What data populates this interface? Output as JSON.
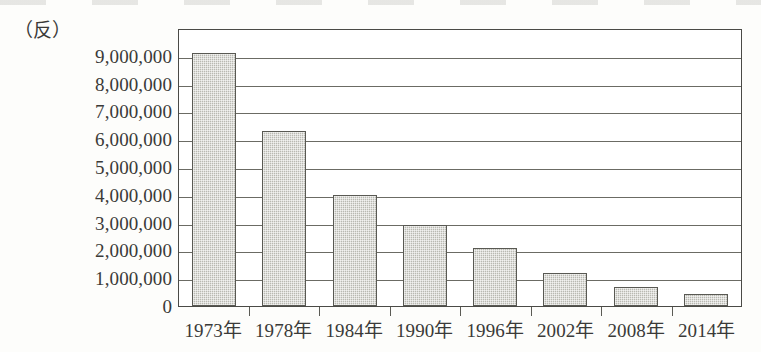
{
  "unit_label": "（反）",
  "chart_data": {
    "type": "bar",
    "title": "",
    "subtitle": "",
    "xlabel": "",
    "ylabel": "（反）",
    "unit": "反",
    "categories": [
      "1973年",
      "1978年",
      "1984年",
      "1990年",
      "1996年",
      "2002年",
      "2008年",
      "2014年"
    ],
    "values": [
      9100000,
      6300000,
      4000000,
      2900000,
      2100000,
      1200000,
      700000,
      450000
    ],
    "ylim": [
      0,
      10000000
    ],
    "ytick_labels": [
      "10,000,000",
      "9,000,000",
      "8,000,000",
      "7,000,000",
      "6,000,000",
      "5,000,000",
      "4,000,000",
      "3,000,000",
      "2,000,000",
      "1,000,000",
      "0"
    ],
    "ytick_values": [
      10000000,
      9000000,
      8000000,
      7000000,
      6000000,
      5000000,
      4000000,
      3000000,
      2000000,
      1000000,
      0
    ],
    "ytick_interval": 1000000,
    "grid": true,
    "grid_axis": "y",
    "legend": false,
    "legend_position": "none",
    "series": [
      {
        "name": "",
        "values": [
          9100000,
          6300000,
          4000000,
          2900000,
          2100000,
          1200000,
          700000,
          450000
        ]
      }
    ],
    "colors": {
      "bar_fill": "#b9b9b1",
      "bar_border": "#595953",
      "gridline": "#6b6b64",
      "frame": "#4a4a46",
      "text": "#3a3a38",
      "background": "#fdfdfb"
    }
  }
}
